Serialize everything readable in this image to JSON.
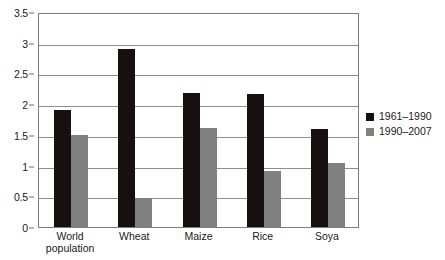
{
  "chart_data": {
    "type": "bar",
    "title": "",
    "subtitle": "",
    "xlabel": "",
    "ylabel": "",
    "categories": [
      "World\npopulation",
      "Wheat",
      "Maize",
      "Rice",
      "Soya"
    ],
    "series": [
      {
        "name": "1961–1990",
        "color": "#17100e",
        "values": [
          1.9,
          2.89,
          2.18,
          2.17,
          1.6
        ]
      },
      {
        "name": "1990–2007",
        "color": "#808080",
        "values": [
          1.5,
          0.48,
          1.62,
          0.91,
          1.05
        ]
      }
    ],
    "ylim": [
      0,
      3.5
    ],
    "yticks": [
      0,
      0.5,
      1,
      1.5,
      2,
      2.5,
      3,
      3.5
    ],
    "ytick_labels": [
      "0",
      "0.5",
      "1",
      "1.5",
      "2",
      "2.5",
      "3",
      "3.5"
    ],
    "grid": true,
    "grid_axis": "y",
    "legend_position": "right",
    "annotations": []
  },
  "colors": {
    "series_a": "#17100e",
    "series_b": "#808080",
    "frame": "#7c7c7c",
    "gridline": "#8d8d8d",
    "text": "#1a1a1a",
    "background": "#ffffff"
  }
}
